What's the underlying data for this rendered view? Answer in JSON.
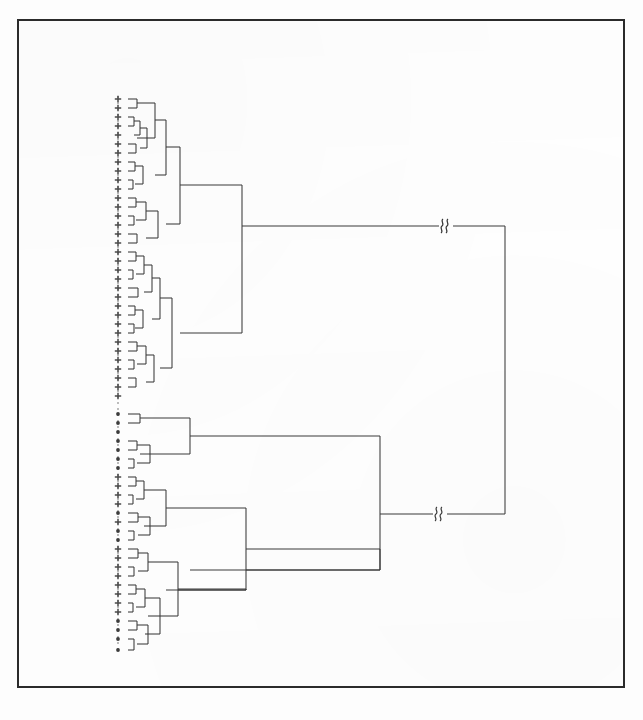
{
  "figure": {
    "domain": "chart",
    "kind": "dendrogram",
    "title": "",
    "caption": "",
    "background_color": "#fdfdfd",
    "frame": {
      "name": "figure-border",
      "color": "#2b2b2b",
      "x": 17,
      "y": 19,
      "width": 608,
      "height": 669,
      "stroke_width": 2
    },
    "ink_color": "#3a3a3a",
    "leaf_axis": {
      "name": "leaf-dashed-axis",
      "x": 118,
      "y_top": 96,
      "y_bottom": 654,
      "style": "dashed",
      "color": "#7d7d7d",
      "dash": "2 4"
    }
  },
  "chart_data": {
    "type": "dendrogram",
    "xlabel": "",
    "ylabel": "",
    "orientation": "horizontal-right",
    "axis_breaks": [
      {
        "label": "break",
        "symbol": "§",
        "x": 446,
        "y": 226
      },
      {
        "label": "break",
        "symbol": "§",
        "x": 440,
        "y": 514
      }
    ],
    "leaf_marker_legend": [
      {
        "symbol": "+",
        "name": "plus-marker",
        "count": 46
      },
      {
        "symbol": "•",
        "name": "dot-marker",
        "count": 15
      }
    ],
    "leaves": [
      {
        "i": 0,
        "y": 99,
        "marker": "+"
      },
      {
        "i": 1,
        "y": 108,
        "marker": "+"
      },
      {
        "i": 2,
        "y": 117,
        "marker": "+"
      },
      {
        "i": 3,
        "y": 126,
        "marker": "+"
      },
      {
        "i": 4,
        "y": 135,
        "marker": "+"
      },
      {
        "i": 5,
        "y": 144,
        "marker": "+"
      },
      {
        "i": 6,
        "y": 153,
        "marker": "+"
      },
      {
        "i": 7,
        "y": 162,
        "marker": "+"
      },
      {
        "i": 8,
        "y": 171,
        "marker": "+"
      },
      {
        "i": 9,
        "y": 180,
        "marker": "+"
      },
      {
        "i": 10,
        "y": 189,
        "marker": "+"
      },
      {
        "i": 11,
        "y": 198,
        "marker": "+"
      },
      {
        "i": 12,
        "y": 207,
        "marker": "+"
      },
      {
        "i": 13,
        "y": 216,
        "marker": "+"
      },
      {
        "i": 14,
        "y": 225,
        "marker": "+"
      },
      {
        "i": 15,
        "y": 234,
        "marker": "+"
      },
      {
        "i": 16,
        "y": 243,
        "marker": "+"
      },
      {
        "i": 17,
        "y": 252,
        "marker": "+"
      },
      {
        "i": 18,
        "y": 261,
        "marker": "+"
      },
      {
        "i": 19,
        "y": 270,
        "marker": "+"
      },
      {
        "i": 20,
        "y": 279,
        "marker": "+"
      },
      {
        "i": 21,
        "y": 288,
        "marker": "+"
      },
      {
        "i": 22,
        "y": 297,
        "marker": "+"
      },
      {
        "i": 23,
        "y": 306,
        "marker": "+"
      },
      {
        "i": 24,
        "y": 315,
        "marker": "+"
      },
      {
        "i": 25,
        "y": 324,
        "marker": "+"
      },
      {
        "i": 26,
        "y": 333,
        "marker": "+"
      },
      {
        "i": 27,
        "y": 342,
        "marker": "+"
      },
      {
        "i": 28,
        "y": 351,
        "marker": "+"
      },
      {
        "i": 29,
        "y": 360,
        "marker": "+"
      },
      {
        "i": 30,
        "y": 369,
        "marker": "+"
      },
      {
        "i": 31,
        "y": 378,
        "marker": "+"
      },
      {
        "i": 32,
        "y": 387,
        "marker": "+"
      },
      {
        "i": 33,
        "y": 396,
        "marker": "+"
      },
      {
        "i": 34,
        "y": 414,
        "marker": "•"
      },
      {
        "i": 35,
        "y": 423,
        "marker": "•"
      },
      {
        "i": 36,
        "y": 432,
        "marker": "•"
      },
      {
        "i": 37,
        "y": 441,
        "marker": "•"
      },
      {
        "i": 38,
        "y": 450,
        "marker": "•"
      },
      {
        "i": 39,
        "y": 459,
        "marker": "•"
      },
      {
        "i": 40,
        "y": 468,
        "marker": "•"
      },
      {
        "i": 41,
        "y": 477,
        "marker": "+"
      },
      {
        "i": 42,
        "y": 486,
        "marker": "+"
      },
      {
        "i": 43,
        "y": 495,
        "marker": "+"
      },
      {
        "i": 44,
        "y": 504,
        "marker": "+"
      },
      {
        "i": 45,
        "y": 513,
        "marker": "•"
      },
      {
        "i": 46,
        "y": 522,
        "marker": "+"
      },
      {
        "i": 47,
        "y": 531,
        "marker": "•"
      },
      {
        "i": 48,
        "y": 540,
        "marker": "•"
      },
      {
        "i": 49,
        "y": 549,
        "marker": "+"
      },
      {
        "i": 50,
        "y": 558,
        "marker": "+"
      },
      {
        "i": 51,
        "y": 567,
        "marker": "+"
      },
      {
        "i": 52,
        "y": 576,
        "marker": "+"
      },
      {
        "i": 53,
        "y": 585,
        "marker": "+"
      },
      {
        "i": 54,
        "y": 594,
        "marker": "+"
      },
      {
        "i": 55,
        "y": 603,
        "marker": "+"
      },
      {
        "i": 56,
        "y": 612,
        "marker": "+"
      },
      {
        "i": 57,
        "y": 621,
        "marker": "•"
      },
      {
        "i": 58,
        "y": 630,
        "marker": "•"
      },
      {
        "i": 59,
        "y": 639,
        "marker": "•"
      },
      {
        "i": 60,
        "y": 650,
        "marker": "•"
      }
    ],
    "links": [
      {
        "id": "L0",
        "x_leaf": 128,
        "x_merge": 137,
        "y1": 99,
        "y2": 108
      },
      {
        "id": "L1",
        "x_leaf": 128,
        "x_merge": 134,
        "y1": 117,
        "y2": 126
      },
      {
        "id": "L2",
        "x_leaf": 134,
        "x_merge": 140,
        "y1": 121,
        "y2": 135
      },
      {
        "id": "L3",
        "x_leaf": 128,
        "x_merge": 136,
        "y1": 144,
        "y2": 153
      },
      {
        "id": "L4",
        "x_leaf": 140,
        "x_merge": 147,
        "y1": 128,
        "y2": 148
      },
      {
        "id": "L5",
        "x_leaf": 137,
        "x_merge": 155,
        "y1": 103,
        "y2": 138
      },
      {
        "id": "L6",
        "x_leaf": 128,
        "x_merge": 135,
        "y1": 162,
        "y2": 171
      },
      {
        "id": "L7",
        "x_leaf": 128,
        "x_merge": 133,
        "y1": 180,
        "y2": 189
      },
      {
        "id": "L8",
        "x_leaf": 135,
        "x_merge": 143,
        "y1": 166,
        "y2": 184
      },
      {
        "id": "L9",
        "x_leaf": 155,
        "x_merge": 166,
        "y1": 120,
        "y2": 175
      },
      {
        "id": "L10",
        "x_leaf": 128,
        "x_merge": 136,
        "y1": 198,
        "y2": 207
      },
      {
        "id": "L11",
        "x_leaf": 128,
        "x_merge": 134,
        "y1": 216,
        "y2": 225
      },
      {
        "id": "L12",
        "x_leaf": 136,
        "x_merge": 146,
        "y1": 202,
        "y2": 220
      },
      {
        "id": "L13",
        "x_leaf": 128,
        "x_merge": 137,
        "y1": 234,
        "y2": 243
      },
      {
        "id": "L14",
        "x_leaf": 146,
        "x_merge": 158,
        "y1": 211,
        "y2": 238
      },
      {
        "id": "L15",
        "x_leaf": 166,
        "x_merge": 180,
        "y1": 147,
        "y2": 224
      },
      {
        "id": "L16",
        "x_leaf": 128,
        "x_merge": 136,
        "y1": 252,
        "y2": 261
      },
      {
        "id": "L17",
        "x_leaf": 128,
        "x_merge": 133,
        "y1": 270,
        "y2": 279
      },
      {
        "id": "L18",
        "x_leaf": 136,
        "x_merge": 144,
        "y1": 256,
        "y2": 274
      },
      {
        "id": "L19",
        "x_leaf": 128,
        "x_merge": 138,
        "y1": 288,
        "y2": 297
      },
      {
        "id": "L20",
        "x_leaf": 144,
        "x_merge": 152,
        "y1": 265,
        "y2": 292
      },
      {
        "id": "L21",
        "x_leaf": 128,
        "x_merge": 135,
        "y1": 306,
        "y2": 315
      },
      {
        "id": "L22",
        "x_leaf": 128,
        "x_merge": 134,
        "y1": 324,
        "y2": 333
      },
      {
        "id": "L23",
        "x_leaf": 135,
        "x_merge": 143,
        "y1": 310,
        "y2": 328
      },
      {
        "id": "L24",
        "x_leaf": 152,
        "x_merge": 160,
        "y1": 278,
        "y2": 319
      },
      {
        "id": "L25",
        "x_leaf": 128,
        "x_merge": 137,
        "y1": 342,
        "y2": 351
      },
      {
        "id": "L26",
        "x_leaf": 128,
        "x_merge": 134,
        "y1": 360,
        "y2": 369
      },
      {
        "id": "L27",
        "x_leaf": 137,
        "x_merge": 146,
        "y1": 346,
        "y2": 364
      },
      {
        "id": "L28",
        "x_leaf": 128,
        "x_merge": 136,
        "y1": 378,
        "y2": 387
      },
      {
        "id": "L29",
        "x_leaf": 146,
        "x_merge": 154,
        "y1": 355,
        "y2": 382
      },
      {
        "id": "L30",
        "x_leaf": 160,
        "x_merge": 172,
        "y1": 298,
        "y2": 368
      },
      {
        "id": "L31",
        "x_leaf": 180,
        "x_merge": 242,
        "y1": 185,
        "y2": 333
      },
      {
        "id": "L32",
        "x_leaf": 128,
        "x_merge": 140,
        "y1": 414,
        "y2": 423
      },
      {
        "id": "L33",
        "x_leaf": 128,
        "x_merge": 137,
        "y1": 441,
        "y2": 450
      },
      {
        "id": "L34",
        "x_leaf": 128,
        "x_merge": 134,
        "y1": 459,
        "y2": 468
      },
      {
        "id": "L35",
        "x_leaf": 137,
        "x_merge": 150,
        "y1": 445,
        "y2": 463
      },
      {
        "id": "L36",
        "x_leaf": 140,
        "x_merge": 190,
        "y1": 418,
        "y2": 454
      },
      {
        "id": "L37",
        "x_leaf": 128,
        "x_merge": 136,
        "y1": 477,
        "y2": 486
      },
      {
        "id": "L38",
        "x_leaf": 128,
        "x_merge": 133,
        "y1": 495,
        "y2": 504
      },
      {
        "id": "L39",
        "x_leaf": 136,
        "x_merge": 144,
        "y1": 481,
        "y2": 499
      },
      {
        "id": "L40",
        "x_leaf": 128,
        "x_merge": 138,
        "y1": 513,
        "y2": 522
      },
      {
        "id": "L41",
        "x_leaf": 128,
        "x_merge": 134,
        "y1": 531,
        "y2": 540
      },
      {
        "id": "L42",
        "x_leaf": 138,
        "x_merge": 150,
        "y1": 517,
        "y2": 535
      },
      {
        "id": "L43",
        "x_leaf": 144,
        "x_merge": 166,
        "y1": 490,
        "y2": 526
      },
      {
        "id": "L44",
        "x_leaf": 166,
        "x_merge": 246,
        "y1": 508,
        "y2": 590
      },
      {
        "id": "L45",
        "x_leaf": 128,
        "x_merge": 138,
        "y1": 549,
        "y2": 558
      },
      {
        "id": "L46",
        "x_leaf": 128,
        "x_merge": 134,
        "y1": 567,
        "y2": 576
      },
      {
        "id": "L47",
        "x_leaf": 138,
        "x_merge": 148,
        "y1": 553,
        "y2": 571
      },
      {
        "id": "L48",
        "x_leaf": 128,
        "x_merge": 136,
        "y1": 585,
        "y2": 594
      },
      {
        "id": "L49",
        "x_leaf": 128,
        "x_merge": 133,
        "y1": 603,
        "y2": 612
      },
      {
        "id": "L50",
        "x_leaf": 136,
        "x_merge": 145,
        "y1": 589,
        "y2": 607
      },
      {
        "id": "L51",
        "x_leaf": 128,
        "x_merge": 137,
        "y1": 621,
        "y2": 630
      },
      {
        "id": "L52",
        "x_leaf": 128,
        "x_merge": 134,
        "y1": 639,
        "y2": 650
      },
      {
        "id": "L53",
        "x_leaf": 137,
        "x_merge": 148,
        "y1": 625,
        "y2": 644
      },
      {
        "id": "L54",
        "x_leaf": 145,
        "x_merge": 160,
        "y1": 598,
        "y2": 634
      },
      {
        "id": "L55",
        "x_leaf": 148,
        "x_merge": 178,
        "y1": 562,
        "y2": 616
      },
      {
        "id": "L56",
        "x_leaf": 190,
        "x_merge": 380,
        "y1": 436,
        "y2": 570
      },
      {
        "id": "L57",
        "x_leaf": 246,
        "x_merge": 380,
        "y1": 549,
        "y2": 570
      },
      {
        "id": "L58",
        "x_leaf": 178,
        "x_merge": 246,
        "y1": 589,
        "y2": 590
      }
    ],
    "root": {
      "name": "root-link",
      "x_merge": 505,
      "y_upper": 226,
      "y_lower": 514,
      "x_upper_child": 242,
      "x_lower_child": 380
    }
  }
}
